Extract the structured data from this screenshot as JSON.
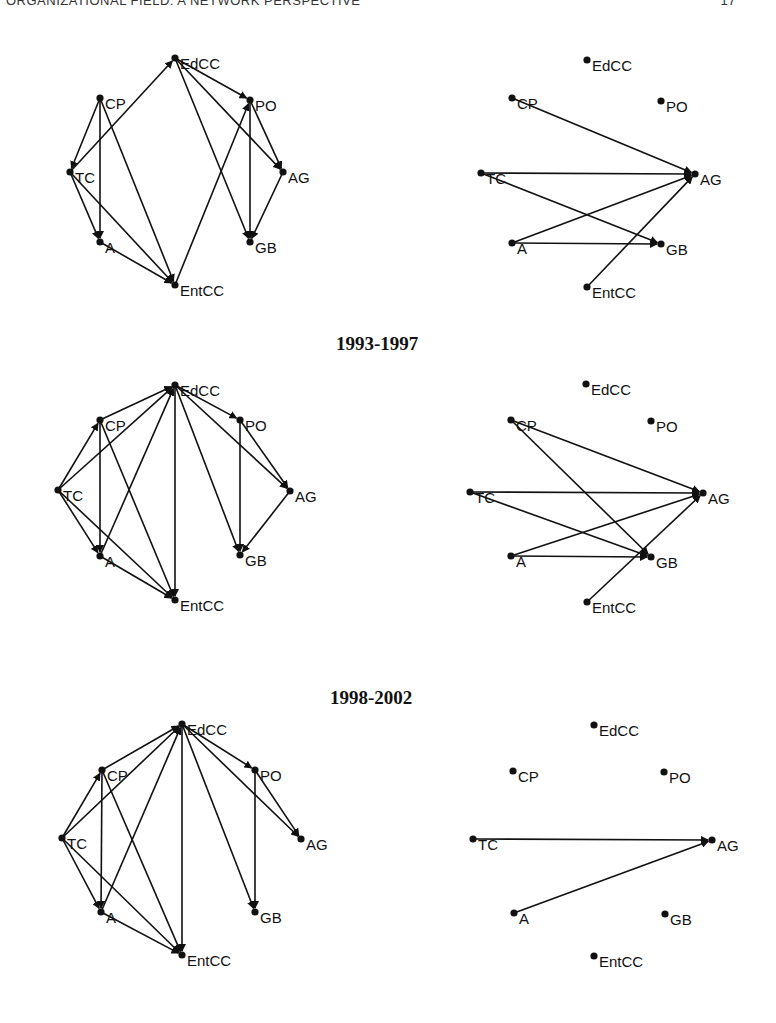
{
  "header": {
    "running_title": "ORGANIZATIONAL FIELD: A NETWORK PERSPECTIVE",
    "page_number": "17"
  },
  "period_titles": [
    {
      "label": "1993-1997",
      "x": 336,
      "y": 333
    },
    {
      "label": "1998-2002",
      "x": 330,
      "y": 687
    }
  ],
  "node_names": [
    "EdCC",
    "CP",
    "PO",
    "TC",
    "AG",
    "A",
    "GB",
    "EntCC"
  ],
  "networks": [
    {
      "id": "row1-left",
      "nodes": {
        "EdCC": [
          175,
          58
        ],
        "CP": [
          100,
          98
        ],
        "PO": [
          250,
          100
        ],
        "TC": [
          70,
          172
        ],
        "AG": [
          283,
          172
        ],
        "A": [
          100,
          242
        ],
        "GB": [
          250,
          242
        ],
        "EntCC": [
          175,
          285
        ]
      },
      "edges": [
        [
          "TC",
          "EdCC"
        ],
        [
          "EdCC",
          "PO"
        ],
        [
          "EdCC",
          "AG"
        ],
        [
          "EdCC",
          "GB"
        ],
        [
          "CP",
          "TC"
        ],
        [
          "CP",
          "A"
        ],
        [
          "CP",
          "EntCC"
        ],
        [
          "TC",
          "A"
        ],
        [
          "TC",
          "EntCC"
        ],
        [
          "A",
          "EntCC"
        ],
        [
          "EntCC",
          "PO"
        ],
        [
          "PO",
          "GB"
        ],
        [
          "PO",
          "AG"
        ],
        [
          "AG",
          "GB"
        ]
      ]
    },
    {
      "id": "row1-right",
      "nodes": {
        "EdCC": [
          587,
          60
        ],
        "CP": [
          512,
          98
        ],
        "PO": [
          661,
          101
        ],
        "TC": [
          481,
          173
        ],
        "AG": [
          695,
          174
        ],
        "A": [
          512,
          243
        ],
        "GB": [
          661,
          244
        ],
        "EntCC": [
          587,
          287
        ]
      },
      "edges": [
        [
          "CP",
          "AG"
        ],
        [
          "TC",
          "AG"
        ],
        [
          "TC",
          "GB"
        ],
        [
          "A",
          "AG"
        ],
        [
          "A",
          "GB"
        ],
        [
          "EntCC",
          "AG"
        ]
      ]
    },
    {
      "id": "row2-left",
      "nodes": {
        "EdCC": [
          175,
          385
        ],
        "CP": [
          100,
          420
        ],
        "PO": [
          240,
          420
        ],
        "TC": [
          58,
          490
        ],
        "AG": [
          290,
          491
        ],
        "A": [
          100,
          556
        ],
        "GB": [
          240,
          555
        ],
        "EntCC": [
          175,
          600
        ]
      },
      "edges": [
        [
          "CP",
          "EdCC"
        ],
        [
          "TC",
          "EdCC"
        ],
        [
          "A",
          "EdCC"
        ],
        [
          "EdCC",
          "EntCC"
        ],
        [
          "EdCC",
          "PO"
        ],
        [
          "EdCC",
          "AG"
        ],
        [
          "EdCC",
          "GB"
        ],
        [
          "TC",
          "CP"
        ],
        [
          "CP",
          "A"
        ],
        [
          "CP",
          "EntCC"
        ],
        [
          "TC",
          "A"
        ],
        [
          "TC",
          "EntCC"
        ],
        [
          "A",
          "EntCC"
        ],
        [
          "PO",
          "GB"
        ],
        [
          "PO",
          "AG"
        ],
        [
          "AG",
          "GB"
        ]
      ]
    },
    {
      "id": "row2-right",
      "nodes": {
        "EdCC": [
          586,
          384
        ],
        "CP": [
          511,
          420
        ],
        "PO": [
          651,
          421
        ],
        "TC": [
          470,
          492
        ],
        "AG": [
          703,
          493
        ],
        "A": [
          511,
          556
        ],
        "GB": [
          651,
          557
        ],
        "EntCC": [
          587,
          602
        ]
      },
      "edges": [
        [
          "CP",
          "AG"
        ],
        [
          "CP",
          "GB"
        ],
        [
          "TC",
          "AG"
        ],
        [
          "TC",
          "GB"
        ],
        [
          "A",
          "AG"
        ],
        [
          "A",
          "GB"
        ],
        [
          "EntCC",
          "AG"
        ]
      ]
    },
    {
      "id": "row3-left",
      "nodes": {
        "EdCC": [
          182,
          724
        ],
        "CP": [
          102,
          770
        ],
        "PO": [
          255,
          770
        ],
        "TC": [
          62,
          838
        ],
        "AG": [
          301,
          839
        ],
        "A": [
          101,
          912
        ],
        "GB": [
          255,
          912
        ],
        "EntCC": [
          182,
          955
        ]
      },
      "edges": [
        [
          "CP",
          "EdCC"
        ],
        [
          "TC",
          "EdCC"
        ],
        [
          "A",
          "EdCC"
        ],
        [
          "EdCC",
          "EntCC"
        ],
        [
          "EdCC",
          "PO"
        ],
        [
          "EdCC",
          "AG"
        ],
        [
          "EdCC",
          "GB"
        ],
        [
          "TC",
          "CP"
        ],
        [
          "CP",
          "A"
        ],
        [
          "CP",
          "EntCC"
        ],
        [
          "TC",
          "A"
        ],
        [
          "TC",
          "EntCC"
        ],
        [
          "A",
          "EntCC"
        ],
        [
          "PO",
          "GB"
        ],
        [
          "PO",
          "AG"
        ]
      ]
    },
    {
      "id": "row3-right",
      "nodes": {
        "EdCC": [
          594,
          725
        ],
        "CP": [
          513,
          771
        ],
        "PO": [
          664,
          772
        ],
        "TC": [
          473,
          839
        ],
        "AG": [
          712,
          840
        ],
        "A": [
          514,
          913
        ],
        "GB": [
          665,
          914
        ],
        "EntCC": [
          594,
          956
        ]
      },
      "edges": [
        [
          "TC",
          "AG"
        ],
        [
          "A",
          "AG"
        ]
      ]
    }
  ],
  "colors": {
    "ink": "#111111",
    "background": "#ffffff"
  }
}
